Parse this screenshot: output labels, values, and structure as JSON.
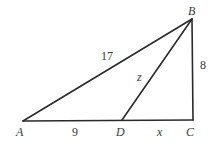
{
  "diagram": {
    "type": "geometry-triangle",
    "vertices": {
      "A": {
        "label": "A",
        "x": 23,
        "y": 121
      },
      "B": {
        "label": "B",
        "x": 192,
        "y": 19
      },
      "C": {
        "label": "C",
        "x": 193,
        "y": 120
      },
      "D": {
        "label": "D",
        "x": 122,
        "y": 120
      }
    },
    "segments": [
      {
        "from": "A",
        "to": "B",
        "label": "17"
      },
      {
        "from": "B",
        "to": "C",
        "label": "8"
      },
      {
        "from": "A",
        "to": "D",
        "label": "9"
      },
      {
        "from": "D",
        "to": "C",
        "label": "x"
      },
      {
        "from": "B",
        "to": "D",
        "label": "z"
      }
    ],
    "labels": {
      "vertex_a": "A",
      "vertex_b": "B",
      "vertex_c": "C",
      "vertex_d": "D",
      "side_ab": "17",
      "side_bc": "8",
      "side_ad": "9",
      "side_dc": "x",
      "side_bd": "z"
    },
    "colors": {
      "stroke": "#2a2a2a",
      "text": "#3a3a3a",
      "background": "#ffffff"
    }
  }
}
